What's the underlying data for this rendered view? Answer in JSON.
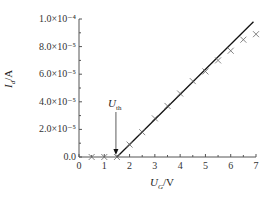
{
  "chart_data": {
    "type": "scatter",
    "title": "",
    "xlabel": "U_G/V",
    "ylabel": "I_d/A",
    "xlim": [
      0,
      7
    ],
    "ylim": [
      0,
      0.0001
    ],
    "x_ticks": [
      "0",
      "1",
      "2",
      "3",
      "4",
      "5",
      "6",
      "7"
    ],
    "y_ticks": [
      "0.0",
      "2.0×10⁻⁵",
      "4.0×10⁻⁵",
      "6.0×10⁻⁵",
      "8.0×10⁻⁵",
      "1.0×10⁻⁴"
    ],
    "grid": false,
    "series": [
      {
        "name": "measured",
        "marker": "x",
        "x": [
          0.5,
          1.0,
          1.5,
          2.0,
          2.5,
          3.0,
          3.5,
          4.0,
          4.5,
          5.0,
          5.5,
          6.0,
          6.5,
          7.0
        ],
        "y": [
          0,
          0,
          0,
          9e-06,
          1.8e-05,
          2.8e-05,
          3.7e-05,
          4.6e-05,
          5.5e-05,
          6.2e-05,
          7e-05,
          7.7e-05,
          8.5e-05,
          8.9e-05
        ]
      },
      {
        "name": "linear fit",
        "type": "line",
        "x": [
          1.5,
          6.9
        ],
        "y": [
          0,
          9.8e-05
        ]
      }
    ],
    "annotations": [
      {
        "text": "U_th",
        "x": 1.5,
        "arrow_to_y": 0
      }
    ]
  },
  "labels": {
    "xlabel_main": "U",
    "xlabel_sub": "G",
    "xlabel_unit": "/V",
    "ylabel_main": "I",
    "ylabel_sub": "d",
    "ylabel_unit": "/A",
    "annot_main": "U",
    "annot_sub": "th"
  }
}
